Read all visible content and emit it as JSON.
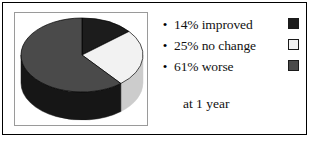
{
  "figure": {
    "caption": "at 1 year",
    "border_color": "#000000",
    "plot_frame_color": "#9a9a9a",
    "background": "#ffffff"
  },
  "legend": {
    "bullet_glyph": "•",
    "items": [
      {
        "label": "14% improved",
        "swatch_color": "#1c1c1c"
      },
      {
        "label": "25% no change",
        "swatch_color": "#f2f2f2"
      },
      {
        "label": "61% worse",
        "swatch_color": "#4a4a4a"
      }
    ]
  },
  "chart_data": {
    "type": "pie",
    "title": "",
    "subtitle": "at 1 year",
    "three_d": true,
    "labels": [
      "14% improved",
      "25% no change",
      "61% worse"
    ],
    "categories": [
      "improved",
      "no change",
      "worse"
    ],
    "values": [
      14,
      25,
      61
    ],
    "units": "percent",
    "colors": [
      "#1c1c1c",
      "#f2f2f2",
      "#4a4a4a"
    ],
    "side_colors": [
      "#0a0a0a",
      "#cccccc",
      "#161616"
    ],
    "start_angle_deg": 0,
    "direction": "clockwise",
    "legend_position": "right",
    "grid": false,
    "geometry": {
      "cx": 68,
      "cy": 43,
      "rx": 61,
      "ry": 37,
      "depth": 28
    }
  }
}
